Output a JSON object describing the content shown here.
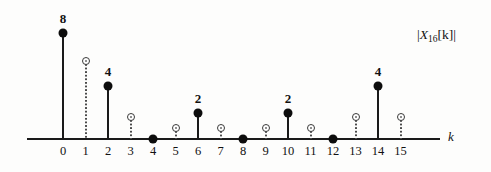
{
  "chart_data": {
    "type": "stem",
    "title": "",
    "xlabel": "k",
    "ylabel": "|X_16[k]|",
    "ylabel_base": "X",
    "ylabel_sub": "16",
    "ylabel_index": "[k]",
    "xlim": [
      -0.6,
      16.2
    ],
    "ylim": [
      0,
      9.2
    ],
    "grid": false,
    "legend": null,
    "x": [
      0,
      1,
      2,
      3,
      4,
      5,
      6,
      7,
      8,
      9,
      10,
      11,
      12,
      13,
      14,
      15
    ],
    "xtick_labels": [
      "0",
      "1",
      "2",
      "3",
      "4",
      "5",
      "6",
      "7",
      "8",
      "9",
      "10",
      "11",
      "12",
      "13",
      "14",
      "15"
    ],
    "series": [
      {
        "name": "sampled-values-filled",
        "marker": "filled-circle",
        "stem": "solid",
        "points": [
          {
            "k": 0,
            "value": 8,
            "label": "8"
          },
          {
            "k": 2,
            "value": 4,
            "label": "4"
          },
          {
            "k": 4,
            "value": 0,
            "label": ""
          },
          {
            "k": 6,
            "value": 2,
            "label": "2"
          },
          {
            "k": 8,
            "value": 0,
            "label": ""
          },
          {
            "k": 10,
            "value": 2,
            "label": "2"
          },
          {
            "k": 12,
            "value": 0,
            "label": ""
          },
          {
            "k": 14,
            "value": 4,
            "label": "4"
          }
        ]
      },
      {
        "name": "interpolated-values-open",
        "marker": "open-circle",
        "stem": "dotted",
        "points": [
          {
            "k": 1,
            "value": 5.9,
            "label": ""
          },
          {
            "k": 3,
            "value": 1.7,
            "label": ""
          },
          {
            "k": 5,
            "value": 0.8,
            "label": ""
          },
          {
            "k": 7,
            "value": 0.8,
            "label": ""
          },
          {
            "k": 9,
            "value": 0.8,
            "label": ""
          },
          {
            "k": 11,
            "value": 0.8,
            "label": ""
          },
          {
            "k": 13,
            "value": 1.7,
            "label": ""
          },
          {
            "k": 15,
            "value": 1.7,
            "label": ""
          }
        ]
      }
    ],
    "colors": {
      "axis": "#1a1a1a",
      "filled_marker": "#0d0d0d",
      "open_marker": "#3a3a3a",
      "dotted_stem": "#4a4a4a",
      "text": "#111111",
      "background": "#fdfdfc"
    }
  }
}
